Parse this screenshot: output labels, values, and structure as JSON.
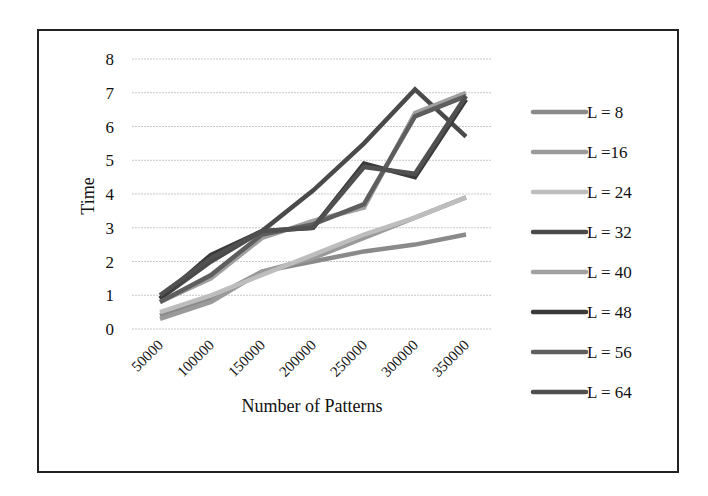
{
  "chart_data": {
    "type": "line",
    "title": "",
    "xlabel": "Number of Patterns",
    "ylabel": "Time",
    "ylim": [
      0,
      8
    ],
    "yticks": [
      0,
      1,
      2,
      3,
      4,
      5,
      6,
      7,
      8
    ],
    "grid": true,
    "legend_position": "right",
    "categories": [
      "50000",
      "100000",
      "150000",
      "200000",
      "250000",
      "300000",
      "350000"
    ],
    "series": [
      {
        "name": "L = 8",
        "color": "#8a8a8a",
        "values": [
          0.4,
          0.9,
          1.7,
          2.0,
          2.3,
          2.5,
          2.8
        ]
      },
      {
        "name": "L =16",
        "color": "#9a9a9a",
        "values": [
          0.3,
          0.8,
          1.7,
          2.1,
          2.7,
          3.3,
          3.9
        ]
      },
      {
        "name": "L = 24",
        "color": "#bdbdbd",
        "values": [
          0.5,
          1.0,
          1.6,
          2.2,
          2.8,
          3.3,
          3.9
        ]
      },
      {
        "name": "L = 32",
        "color": "#4a4a4a",
        "values": [
          0.9,
          2.0,
          2.9,
          4.1,
          5.5,
          7.1,
          5.7
        ]
      },
      {
        "name": "L = 40",
        "color": "#a0a0a0",
        "values": [
          0.8,
          1.5,
          2.7,
          3.2,
          3.6,
          6.4,
          7.0
        ]
      },
      {
        "name": "L = 48",
        "color": "#3a3a3a",
        "values": [
          0.9,
          2.2,
          2.9,
          3.0,
          4.9,
          4.5,
          6.8
        ]
      },
      {
        "name": "L = 56",
        "color": "#5e5e5e",
        "values": [
          0.8,
          1.6,
          2.8,
          3.1,
          3.7,
          6.3,
          6.9
        ]
      },
      {
        "name": "L = 64",
        "color": "#505050",
        "values": [
          1.0,
          2.1,
          2.9,
          3.0,
          4.8,
          4.6,
          6.9
        ]
      }
    ]
  }
}
